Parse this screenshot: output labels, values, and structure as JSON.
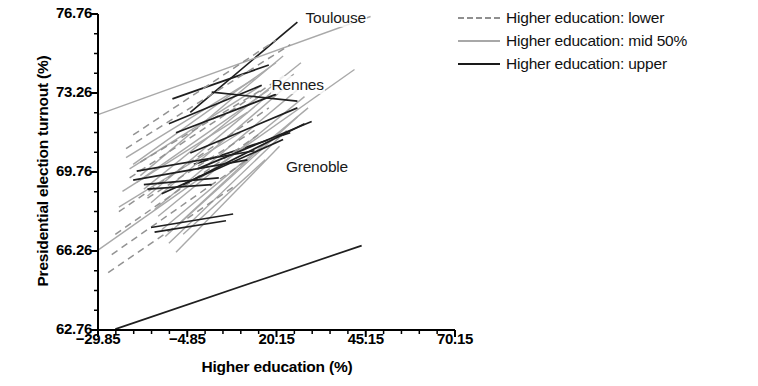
{
  "chart_data": {
    "type": "line",
    "title": "",
    "xlabel": "Higher education (%)",
    "ylabel": "Presidential election turnout (%)",
    "xlim": [
      -29.85,
      70.15
    ],
    "ylim": [
      62.76,
      76.76
    ],
    "xticks": [
      "-29.85",
      "-4.85",
      "20.15",
      "45.15",
      "70.15"
    ],
    "xtick_values": [
      -29.85,
      -4.85,
      20.15,
      45.15,
      70.15
    ],
    "yticks": [
      "62.76",
      "66.26",
      "69.76",
      "73.26",
      "76.76"
    ],
    "ytick_values": [
      62.76,
      66.26,
      69.76,
      73.26,
      76.76
    ],
    "x_minor_ticks_per_interval": 5,
    "y_minor_ticks_per_interval": 4,
    "grid": false,
    "legend_position": "upper right (outside axes)",
    "legend": [
      {
        "label": "Higher education: lower",
        "style": "dashed",
        "color": "#8f8f8f"
      },
      {
        "label": "Higher education: mid 50%",
        "style": "solid",
        "color": "#a8a8a8"
      },
      {
        "label": "Higher education: upper",
        "style": "solid",
        "color": "#1a1a1a"
      }
    ],
    "annotations": [
      {
        "text": "Toulouse",
        "x": 28.0,
        "y": 76.55
      },
      {
        "text": "Rennes",
        "x": 18.5,
        "y": 73.55
      },
      {
        "text": "Grenoble",
        "x": 22.5,
        "y": 69.95
      }
    ],
    "series": [
      {
        "name": "Toulouse",
        "group": "upper",
        "x": [
          -4.0,
          26.0
        ],
        "y": [
          72.4,
          76.4
        ]
      },
      {
        "name": "Rennes",
        "group": "upper",
        "x": [
          -9.0,
          18.0
        ],
        "y": [
          73.0,
          74.5
        ]
      },
      {
        "name": "Grenoble",
        "group": "upper",
        "x": [
          -3.0,
          24.0
        ],
        "y": [
          70.1,
          71.5
        ]
      },
      {
        "name": "line-mid-01",
        "group": "mid",
        "x": [
          -29.85,
          46.5
        ],
        "y": [
          72.3,
          76.65
        ]
      },
      {
        "name": "line-mid-02",
        "group": "mid",
        "x": [
          -29.85,
          42.0
        ],
        "y": [
          66.3,
          74.3
        ]
      },
      {
        "name": "line-mid-03",
        "group": "mid",
        "x": [
          -17.0,
          27.0
        ],
        "y": [
          69.0,
          74.6
        ]
      },
      {
        "name": "line-mid-04",
        "group": "mid",
        "x": [
          -16.0,
          25.0
        ],
        "y": [
          68.7,
          74.1
        ]
      },
      {
        "name": "line-mid-05",
        "group": "mid",
        "x": [
          -15.0,
          24.0
        ],
        "y": [
          68.4,
          73.7
        ]
      },
      {
        "name": "line-mid-06",
        "group": "mid",
        "x": [
          -14.0,
          26.0
        ],
        "y": [
          68.1,
          73.4
        ]
      },
      {
        "name": "line-mid-07",
        "group": "mid",
        "x": [
          -13.0,
          28.0
        ],
        "y": [
          67.8,
          73.1
        ]
      },
      {
        "name": "line-mid-08",
        "group": "mid",
        "x": [
          -18.0,
          22.0
        ],
        "y": [
          69.6,
          74.9
        ]
      },
      {
        "name": "line-mid-09",
        "group": "mid",
        "x": [
          -12.0,
          29.0
        ],
        "y": [
          67.2,
          72.6
        ]
      },
      {
        "name": "line-mid-10",
        "group": "mid",
        "x": [
          -20.0,
          20.0
        ],
        "y": [
          70.1,
          74.6
        ]
      },
      {
        "name": "line-mid-11",
        "group": "mid",
        "x": [
          -11.0,
          26.0
        ],
        "y": [
          66.9,
          72.2
        ]
      },
      {
        "name": "line-mid-12",
        "group": "mid",
        "x": [
          -19.0,
          18.0
        ],
        "y": [
          69.3,
          73.4
        ]
      },
      {
        "name": "line-mid-13",
        "group": "mid",
        "x": [
          -10.0,
          23.0
        ],
        "y": [
          66.6,
          71.6
        ]
      },
      {
        "name": "line-mid-14",
        "group": "mid",
        "x": [
          -21.0,
          16.0
        ],
        "y": [
          69.9,
          73.6
        ]
      },
      {
        "name": "line-mid-15",
        "group": "mid",
        "x": [
          -8.0,
          21.0
        ],
        "y": [
          66.2,
          70.9
        ]
      },
      {
        "name": "line-mid-16",
        "group": "mid",
        "x": [
          -22.0,
          14.0
        ],
        "y": [
          70.4,
          73.9
        ]
      },
      {
        "name": "line-mid-17",
        "group": "mid",
        "x": [
          -7.0,
          19.0
        ],
        "y": [
          67.5,
          71.3
        ]
      },
      {
        "name": "line-mid-18",
        "group": "mid",
        "x": [
          -23.0,
          12.0
        ],
        "y": [
          68.9,
          72.4
        ]
      },
      {
        "name": "line-mid-19",
        "group": "mid",
        "x": [
          -6.0,
          17.0
        ],
        "y": [
          67.0,
          70.3
        ]
      },
      {
        "name": "line-mid-20",
        "group": "mid",
        "x": [
          -24.0,
          10.0
        ],
        "y": [
          68.2,
          71.5
        ]
      },
      {
        "name": "line-lower-01",
        "group": "lower",
        "x": [
          -22.0,
          24.0
        ],
        "y": [
          70.8,
          75.4
        ]
      },
      {
        "name": "line-lower-02",
        "group": "lower",
        "x": [
          -21.0,
          22.0
        ],
        "y": [
          69.5,
          74.0
        ]
      },
      {
        "name": "line-lower-03",
        "group": "lower",
        "x": [
          -24.0,
          18.0
        ],
        "y": [
          68.0,
          72.6
        ]
      },
      {
        "name": "line-lower-04",
        "group": "lower",
        "x": [
          -25.0,
          15.0
        ],
        "y": [
          67.0,
          71.4
        ]
      },
      {
        "name": "line-lower-05",
        "group": "lower",
        "x": [
          -26.0,
          12.0
        ],
        "y": [
          66.1,
          70.3
        ]
      },
      {
        "name": "line-lower-06",
        "group": "lower",
        "x": [
          -27.0,
          9.0
        ],
        "y": [
          65.3,
          69.2
        ]
      },
      {
        "name": "line-lower-07",
        "group": "lower",
        "x": [
          -20.0,
          20.0
        ],
        "y": [
          71.4,
          75.6
        ]
      },
      {
        "name": "line-lower-08",
        "group": "lower",
        "x": [
          -18.0,
          16.0
        ],
        "y": [
          70.2,
          73.4
        ]
      },
      {
        "name": "line-lower-09",
        "group": "lower",
        "x": [
          -16.0,
          14.0
        ],
        "y": [
          68.6,
          71.6
        ]
      },
      {
        "name": "line-upper-long",
        "group": "upper",
        "x": [
          -25.0,
          44.0
        ],
        "y": [
          62.8,
          66.5
        ]
      },
      {
        "name": "line-upper-02",
        "group": "upper",
        "x": [
          -20.0,
          12.0
        ],
        "y": [
          69.4,
          70.3
        ]
      },
      {
        "name": "line-upper-03",
        "group": "upper",
        "x": [
          -19.0,
          14.0
        ],
        "y": [
          69.8,
          70.7
        ]
      },
      {
        "name": "line-upper-04",
        "group": "upper",
        "x": [
          -12.0,
          22.0
        ],
        "y": [
          68.8,
          71.2
        ]
      },
      {
        "name": "line-upper-05",
        "group": "upper",
        "x": [
          -6.0,
          28.0
        ],
        "y": [
          69.2,
          71.9
        ]
      },
      {
        "name": "line-upper-06",
        "group": "upper",
        "x": [
          -2.0,
          30.0
        ],
        "y": [
          69.9,
          72.0
        ]
      },
      {
        "name": "line-upper-07",
        "group": "upper",
        "x": [
          -15.0,
          8.0
        ],
        "y": [
          67.3,
          67.9
        ]
      },
      {
        "name": "line-upper-08",
        "group": "upper",
        "x": [
          -14.0,
          6.0
        ],
        "y": [
          67.1,
          67.6
        ]
      },
      {
        "name": "line-upper-09",
        "group": "upper",
        "x": [
          -17.0,
          4.0
        ],
        "y": [
          69.2,
          69.5
        ]
      },
      {
        "name": "line-upper-10",
        "group": "upper",
        "x": [
          -16.0,
          2.0
        ],
        "y": [
          69.0,
          69.2
        ]
      },
      {
        "name": "line-upper-11",
        "group": "upper",
        "x": [
          -8.0,
          20.0
        ],
        "y": [
          71.5,
          73.2
        ]
      },
      {
        "name": "line-upper-12",
        "group": "upper",
        "x": [
          -10.0,
          16.0
        ],
        "y": [
          71.9,
          73.6
        ]
      },
      {
        "name": "line-upper-13",
        "group": "upper",
        "x": [
          2.0,
          26.0
        ],
        "y": [
          73.3,
          72.9
        ]
      },
      {
        "name": "line-upper-14",
        "group": "upper",
        "x": [
          -4.0,
          26.0
        ],
        "y": [
          70.6,
          72.6
        ]
      }
    ]
  },
  "axes": {
    "ylabel": "Presidential election turnout (%)",
    "xlabel": "Higher education (%)"
  },
  "legend": {
    "items": [
      {
        "label": "Higher education: lower"
      },
      {
        "label": "Higher education: mid 50%"
      },
      {
        "label": "Higher education: upper"
      }
    ]
  }
}
